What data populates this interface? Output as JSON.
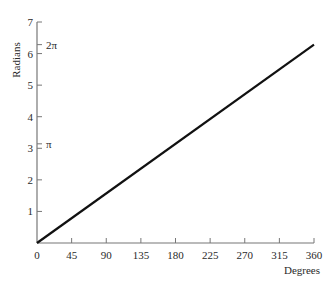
{
  "chart_data": {
    "type": "line",
    "title": "",
    "xlabel": "Degrees",
    "ylabel": "Radians",
    "xlim": [
      0,
      360
    ],
    "ylim": [
      0,
      7
    ],
    "grid": false,
    "legend": null,
    "x_ticks": [
      0,
      45,
      90,
      135,
      180,
      225,
      270,
      315,
      360
    ],
    "y_ticks": [
      1,
      2,
      3,
      4,
      5,
      6,
      7
    ],
    "annotations": [
      {
        "text": "π",
        "y": 3.14159
      },
      {
        "text": "2π",
        "y": 6.28319
      }
    ],
    "series": [
      {
        "name": "radians vs degrees",
        "x": [
          0,
          360
        ],
        "y": [
          0,
          6.28319
        ]
      }
    ]
  },
  "colors": {
    "line": "#111111",
    "axis": "#777777",
    "text": "#2a2a2a"
  }
}
